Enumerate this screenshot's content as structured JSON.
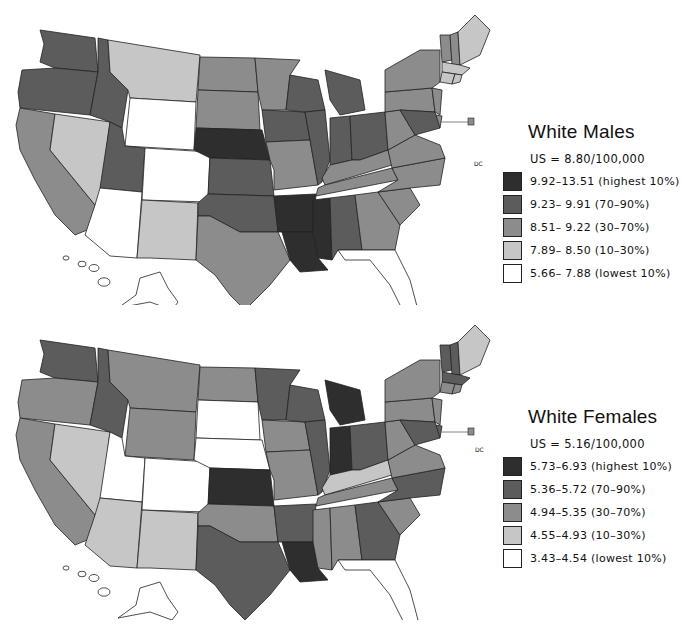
{
  "palette": {
    "highest_10": "#2e2e2e",
    "p70_90": "#5c5c5c",
    "p30_70": "#8c8c8c",
    "p10_30": "#c6c6c6",
    "lowest_10": "#ffffff",
    "outline": "#222222"
  },
  "chart_data": {
    "type": "choropleth",
    "maps": [
      {
        "title": "White Males",
        "us_rate": "US = 8.80/100,000",
        "us_rate_value": 8.8,
        "unit": "per 100,000",
        "legend": [
          {
            "range": "9.92-13.51",
            "label": "9.92–13.51 (highest 10%)",
            "min": 9.92,
            "max": 13.51,
            "percentile": "highest 10%",
            "color": "#2e2e2e"
          },
          {
            "range": "9.23-9.91",
            "label": "9.23– 9.91 (70–90%)",
            "min": 9.23,
            "max": 9.91,
            "percentile": "70-90%",
            "color": "#5c5c5c"
          },
          {
            "range": "8.51-9.22",
            "label": "8.51– 9.22 (30–70%)",
            "min": 8.51,
            "max": 9.22,
            "percentile": "30-70%",
            "color": "#8c8c8c"
          },
          {
            "range": "7.89-8.50",
            "label": "7.89– 8.50 (10–30%)",
            "min": 7.89,
            "max": 8.5,
            "percentile": "10-30%",
            "color": "#c6c6c6"
          },
          {
            "range": "5.66-7.88",
            "label": "5.66– 7.88 (lowest 10%)",
            "min": 5.66,
            "max": 7.88,
            "percentile": "lowest 10%",
            "color": "#ffffff"
          }
        ],
        "regional_pattern": {
          "darkest": [
            "Mississippi Delta",
            "Louisiana",
            "Arkansas",
            "Nebraska/South Dakota border",
            "Minnesota/Iowa",
            "northern Oregon",
            "Ohio"
          ],
          "lightest": [
            "Arizona",
            "New Mexico",
            "Colorado",
            "Wyoming",
            "south Texas",
            "Florida"
          ]
        }
      },
      {
        "title": "White Females",
        "us_rate": "US = 5.16/100,000",
        "us_rate_value": 5.16,
        "unit": "per 100,000",
        "legend": [
          {
            "range": "5.73-6.93",
            "label": "5.73–6.93 (highest 10%)",
            "min": 5.73,
            "max": 6.93,
            "percentile": "highest 10%",
            "color": "#2e2e2e"
          },
          {
            "range": "5.36-5.72",
            "label": "5.36–5.72 (70–90%)",
            "min": 5.36,
            "max": 5.72,
            "percentile": "70-90%",
            "color": "#5c5c5c"
          },
          {
            "range": "4.94-5.35",
            "label": "4.94–5.35 (30–70%)",
            "min": 4.94,
            "max": 5.35,
            "percentile": "30-70%",
            "color": "#8c8c8c"
          },
          {
            "range": "4.55-4.93",
            "label": "4.55–4.93 (10–30%)",
            "min": 4.55,
            "max": 4.93,
            "percentile": "10-30%",
            "color": "#c6c6c6"
          },
          {
            "range": "3.43-4.54",
            "label": "3.43–4.54 (lowest 10%)",
            "min": 3.43,
            "max": 3.54,
            "percentile": "lowest 10%",
            "color": "#ffffff"
          }
        ],
        "regional_pattern": {
          "darkest": [
            "Michigan",
            "Kansas",
            "Louisiana/Mississippi",
            "Indiana/Ohio",
            "north California coast",
            "Minnesota"
          ],
          "lightest": [
            "Utah",
            "Colorado",
            "South Dakota",
            "New Mexico",
            "south Texas",
            "Florida",
            "Kentucky"
          ]
        }
      }
    ],
    "inset_label": "DC"
  },
  "legends": {
    "top": {
      "title": "White Males",
      "us": "US = 8.80/100,000",
      "rows": [
        "9.92–13.51 (highest 10%)",
        "9.23– 9.91 (70–90%)",
        "8.51– 9.22 (30–70%)",
        "7.89– 8.50 (10–30%)",
        "5.66– 7.88 (lowest 10%)"
      ]
    },
    "bottom": {
      "title": "White Females",
      "us": "US = 5.16/100,000",
      "rows": [
        "5.73–6.93 (highest 10%)",
        "5.36–5.72 (70–90%)",
        "4.94–5.35 (30–70%)",
        "4.55–4.93 (10–30%)",
        "3.43–4.54 (lowest 10%)"
      ]
    }
  },
  "map_labels": {
    "dc_top": "DC",
    "dc_bottom": "DC"
  },
  "states_top": {
    "WA": "p70_90",
    "OR": "p70_90",
    "CA": "p30_70",
    "NV": "p10_30",
    "ID": "p70_90",
    "MT": "p10_30",
    "WY": "lowest_10",
    "UT": "p70_90",
    "AZ": "lowest_10",
    "CO": "lowest_10",
    "NM": "p10_30",
    "ND": "p30_70",
    "SD": "p30_70",
    "NE": "highest_10",
    "KS": "p70_90",
    "OK": "p70_90",
    "TX": "p30_70",
    "MN": "p30_70",
    "IA": "p70_90",
    "MO": "p30_70",
    "AR": "highest_10",
    "LA": "highest_10",
    "WI": "p70_90",
    "IL": "p70_90",
    "MI": "p70_90",
    "IN": "p70_90",
    "OH": "p70_90",
    "KY": "p30_70",
    "TN": "p30_70",
    "MS": "highest_10",
    "AL": "p70_90",
    "GA": "p30_70",
    "FL": "lowest_10",
    "SC": "p30_70",
    "NC": "p30_70",
    "VA": "p30_70",
    "WV": "p30_70",
    "PA": "p30_70",
    "NY": "p30_70",
    "VT": "p30_70",
    "NH": "p30_70",
    "ME": "p10_30",
    "MA": "p10_30",
    "CT": "p10_30",
    "RI": "p10_30",
    "NJ": "p30_70",
    "DE": "p30_70",
    "MD": "p70_90"
  },
  "states_bottom": {
    "WA": "p70_90",
    "OR": "p30_70",
    "CA": "p30_70",
    "NV": "p10_30",
    "ID": "p70_90",
    "MT": "p30_70",
    "WY": "p30_70",
    "UT": "lowest_10",
    "AZ": "p10_30",
    "CO": "lowest_10",
    "NM": "p10_30",
    "ND": "p30_70",
    "SD": "lowest_10",
    "NE": "lowest_10",
    "KS": "highest_10",
    "OK": "p30_70",
    "TX": "p70_90",
    "MN": "p70_90",
    "IA": "p30_70",
    "MO": "p30_70",
    "AR": "p70_90",
    "LA": "highest_10",
    "WI": "p70_90",
    "IL": "p70_90",
    "MI": "highest_10",
    "IN": "highest_10",
    "OH": "p70_90",
    "KY": "p10_30",
    "TN": "p30_70",
    "MS": "p30_70",
    "AL": "p30_70",
    "GA": "p70_90",
    "FL": "lowest_10",
    "SC": "p30_70",
    "NC": "p70_90",
    "VA": "p30_70",
    "WV": "p30_70",
    "PA": "p30_70",
    "NY": "p30_70",
    "VT": "p70_90",
    "NH": "p70_90",
    "ME": "p10_30",
    "MA": "p70_90",
    "CT": "p30_70",
    "RI": "p30_70",
    "NJ": "p30_70",
    "DE": "p70_90",
    "MD": "p70_90"
  }
}
